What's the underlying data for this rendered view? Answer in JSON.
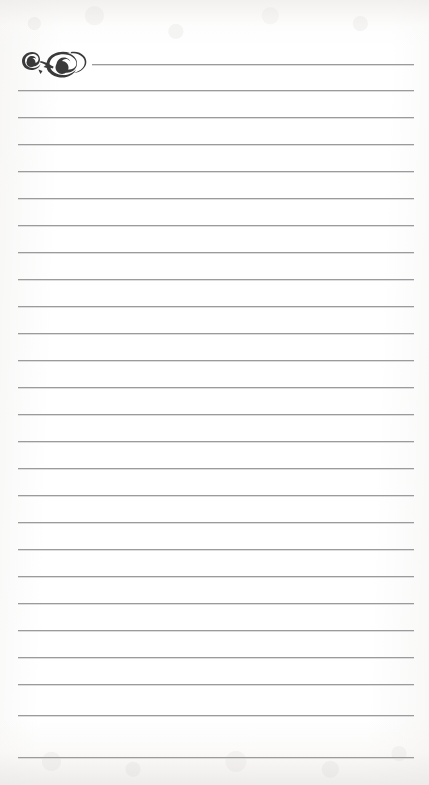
{
  "document": {
    "title": "Lined Stationery Page",
    "type": "blank ruled writing paper",
    "body_text": "",
    "page_number": "",
    "header_text": "",
    "footer_text": ""
  },
  "paper": {
    "background_color": "#fdfdfd",
    "edge_tint_color": "#eeeceа",
    "width_px": 429,
    "height_px": 785
  },
  "ornament": {
    "name": "calligraphic-flourish",
    "description": "decorative double-spiral scroll flourish",
    "color": "#3a3a3a",
    "x_px": 18,
    "y_px": 46,
    "width_px": 74,
    "height_px": 34
  },
  "ruling": {
    "line_color": "#9b9b9b",
    "line_thickness_px": 1,
    "line_count": 26,
    "left_x_px": 18,
    "right_x_px": 414,
    "first_line_left_x_px": 92,
    "spacing_px": 27.3,
    "line_y_positions": [
      64,
      90,
      117,
      144,
      171,
      198,
      225,
      252,
      279,
      306,
      333,
      360,
      387,
      414,
      441,
      468,
      495,
      522,
      549,
      576,
      603,
      630,
      657,
      684,
      715,
      757
    ]
  }
}
